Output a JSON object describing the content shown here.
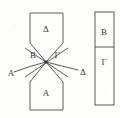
{
  "figure": {
    "type": "line-diagram",
    "background_color": "#fdfdfc",
    "stroke_color": "#4a4a4a",
    "text_color": "#3a3a3a",
    "labels": {
      "top_polygon": "Δ",
      "bottom_polygon": "A",
      "center_left": "B",
      "center_right": "Γ",
      "curve_left_end": "A",
      "curve_right_end": "Δ",
      "right_box_top": "B",
      "right_box_bottom": "Γ"
    },
    "label_positions": {
      "top_polygon": {
        "x": 46,
        "y": 29
      },
      "bottom_polygon": {
        "x": 46,
        "y": 93
      },
      "center_left": {
        "x": 33,
        "y": 55
      },
      "center_right": {
        "x": 57,
        "y": 55
      },
      "curve_left_end": {
        "x": 11,
        "y": 73
      },
      "curve_right_end": {
        "x": 83,
        "y": 72
      },
      "right_box_top": {
        "x": 104,
        "y": 32
      },
      "right_box_bottom": {
        "x": 104,
        "y": 62
      }
    },
    "geometry": {
      "top_polygon_points": "30,13 63,13 63,43 46,62 30,43",
      "bottom_polygon_points": "30,110 30,82 46,62 63,82 63,110",
      "center_point": {
        "x": 46,
        "y": 62
      },
      "cross_line_1": "25,48 68,77",
      "cross_line_2": "68,48 25,77",
      "curve_left": "M 14,72 Q 30,66 46,62",
      "curve_right": "M 78,70 Q 62,66 46,62",
      "right_box": {
        "x": 95,
        "y": 12,
        "width": 19,
        "height": 93
      },
      "right_box_divider_y": 47
    }
  }
}
